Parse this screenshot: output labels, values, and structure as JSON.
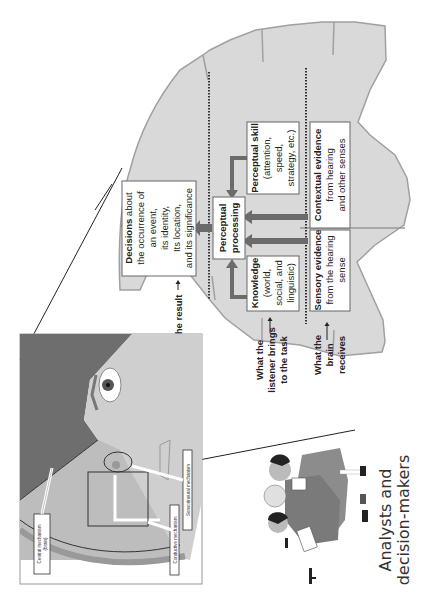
{
  "diagram": {
    "orientation": "rotated-90-ccw",
    "colors": {
      "brain_fill": "#d9d9d9",
      "brain_outline": "#a0a0a0",
      "arrow_fill": "#6b6b6b",
      "dotted_line": "#333333",
      "box_fill": "#ffffff",
      "hair": "#6e6e6e",
      "skin": "#cfcfcf"
    },
    "levels": {
      "result": "The result",
      "listener_line1": "What the",
      "listener_line2": "listener brings",
      "listener_line3": "to the task",
      "brain_line1": "What the",
      "brain_line2": "brain",
      "brain_line3": "receives"
    },
    "boxes": {
      "decisions": {
        "title": "Decisions",
        "line1_rest": " about",
        "line2": "the occurrence of",
        "line3": "an event,",
        "line4": "its identity,",
        "line5": "Its location,",
        "line6": "and its significance"
      },
      "perceptual_processing": {
        "line1": "Perceptual",
        "line2": "processing"
      },
      "knowledge": {
        "title": "Knowledge",
        "line2": "(world,",
        "line3": "social, and",
        "line4": "linguistic)"
      },
      "perceptual_skill": {
        "title": "Perceptual skill",
        "line2": "(attention,",
        "line3": "speed,",
        "line4": "strategy, etc.)"
      },
      "sensory_evidence": {
        "title": "Sensory evidence",
        "line2": "from the hearing",
        "line3": "sense"
      },
      "contextual_evidence": {
        "title": "Contextual evidence",
        "line2": "from hearing",
        "line3": "and other senses"
      }
    },
    "head_inset": {
      "central": {
        "line1": "Central mechanism",
        "line2": "(brain)"
      },
      "conductive": "Conductive mechanism",
      "sensorineural": "Sensorineural mechanism"
    },
    "people": {
      "caption_line1": "Analysts and",
      "caption_line2": "decision-makers"
    }
  }
}
